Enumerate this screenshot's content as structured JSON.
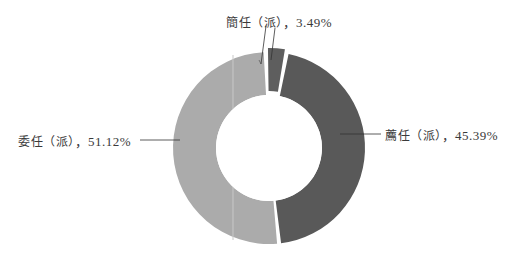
{
  "chart_data": {
    "type": "pie",
    "variant": "donut",
    "title": "",
    "slices": [
      {
        "label": "簡任（派）",
        "value": 3.49,
        "display": "簡任（派），3.49%",
        "color": "#5e5e5e"
      },
      {
        "label": "薦任（派）",
        "value": 45.39,
        "display": "薦任（派），45.39%",
        "color": "#595959"
      },
      {
        "label": "委任（派）",
        "value": 51.12,
        "display": "委任（派），51.12%",
        "color": "#ababab"
      }
    ],
    "legend": "none",
    "labels_position": "outside with leader lines"
  },
  "labels": {
    "jianren_name": "簡任（派）",
    "jianren_value": "，3.49%",
    "jianren_color": "#5e5e5e",
    "jianren_pct": 3.49,
    "jianren_start": -2,
    "jianren_explode": 4,
    "jianren_inner": 53,
    "jianren_outer": 96,
    "jianren_cx": 269,
    "jianren_cy": 148,
    "jianren_seam": "",
    "jianren_seam_color": "",
    "jianren_gap": 1.5,
    "jianren_pad": 0,
    "jianren_k": 0,
    "jianren_skip": 0,
    "jianren_end": 0,
    "jianren_mid": 0,
    "jianren_ann": "簡任（派），3.49%",
    "jianren_pos": "top",
    "jianren_leader": "diagonal",
    "jianren_unused": "",
    "jianren_dummy": "",
    "jianren_note": "",
    "jianren_extra": "",
    "jianren_misc": "",
    "jianren_other": "",
    "jianren_ref": "",
    "jianren_aux": "",
    "jianren_tag": "",
    "jianren_id": "",
    "jianren_key": "",
    "jianren_val": "",
    "jianren_txt": "",
    "jianren_str": "",
    "jianren_raw": "",
    "jianren_fmt": "",
    "jianren_alt": "",
    "jianren_fallback": "",
    "jianren_default": "",
    "jianren_placeholder": "",
    "jianren_hint": "",
    "jianren_tip": "",
    "jianren_desc": "",
    "jianren_caption": "",
    "jianren_title": "",
    "jianren_subtitle": "",
    "jianren_footer": "",
    "jianren_header": "",
    "jianren_body": "",
    "jianren_content": "",
    "jianren_data": "",
    "jianren_info": "",
    "jianren_meta": "",
    "jianren_attr": "",
    "jianren_prop": "",
    "jianren_field": "",
    "jianren_item": "",
    "jianren_entry": "",
    "jianren_record": "",
    "jianren_row": "",
    "jianren_col": "",
    "jianren_cell": "",
    "jianren_node": "",
    "jianren_leaf": "",
    "jianren_root": "",
    "jianren_branch": "",
    "jianren_tree": "",
    "jianren_graph": "",
    "jianren_edge": "",
    "jianren_vertex": "",
    "jianren_point": "",
    "jianren_line": "",
    "jianren_curve": "",
    "jianren_shape": "",
    "jianren_area": "",
    "jianren_region": "",
    "jianren_zone": "",
    "jianren_sector": "",
    "jianren_slice": "",
    "jianren_segment": "",
    "jianren_part": "",
    "jianren_piece": "",
    "jianren_chunk": "",
    "jianren_block": "",
    "jianren_unit": "",
    "jianren_element": "",
    "jianren_component": "",
    "jianren_module": "",
    "jianren_section": "",
    "jianren_division": "",
    "jianren_group": "",
    "jianren_set": "",
    "jianren_list": "",
    "jianren_array": "",
    "jianren_vector": "",
    "jianren_matrix": "",
    "jianren_table": "",
    "jianren_grid": "",
    "jianren_map": "",
    "jianren_dict": "",
    "jianren_hash": "",
    "jianren_index": "",
    "jianren_pointer": "",
    "jianren_link": "",
    "jianren_url": "",
    "jianren_path": "",
    "jianren_route": "",
    "jianren_way": "",
    "jianren_direction": "",
    "jianren_heading": "",
    "jianren_bearing": "",
    "jianren_angle": "",
    "jianren_rotation": "",
    "jianren_orientation": "",
    "jianren_alignment": "",
    "jianren_justification": "",
    "jianren_spacing": "",
    "jianren_padding": "",
    "jianren_margin": "",
    "jianren_border": "",
    "jianren_outline": "",
    "jianren_stroke": "",
    "jianren_fill": ""
  }
}
